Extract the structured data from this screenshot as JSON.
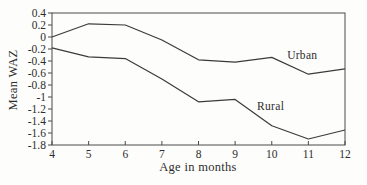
{
  "figure": {
    "background": "#fdfdfc",
    "line_color": "#3b3b3b",
    "frame_color": "#4a4a4a",
    "text_color": "#2d2d2d"
  },
  "chart_data": {
    "type": "line",
    "title": "",
    "xlabel": "Age in months",
    "ylabel": "Mean WAZ",
    "xlim": [
      4,
      12
    ],
    "ylim": [
      -1.8,
      0.4
    ],
    "grid": false,
    "legend_position": "inline-annotations",
    "x": [
      4,
      5,
      6,
      7,
      8,
      9,
      10,
      11,
      12
    ],
    "xticks": [
      "4",
      "5",
      "6",
      "7",
      "8",
      "9",
      "10",
      "11",
      "12"
    ],
    "ytick_values": [
      0.4,
      0.2,
      0,
      -0.2,
      -0.4,
      -0.6,
      -0.8,
      -1,
      -1.2,
      -1.4,
      -1.6,
      -1.8
    ],
    "yticks": [
      "0.4",
      "0.2",
      "0",
      "-0.2",
      "-0.4",
      "-0.6",
      "-0.8",
      "-1",
      "-1.2",
      "-1.4",
      "-1.6",
      "-1.8"
    ],
    "series": [
      {
        "name": "Urban",
        "values": [
          0.0,
          0.22,
          0.2,
          -0.05,
          -0.38,
          -0.42,
          -0.34,
          -0.62,
          -0.53
        ]
      },
      {
        "name": "Rural",
        "values": [
          -0.18,
          -0.33,
          -0.36,
          -0.7,
          -1.08,
          -1.04,
          -1.48,
          -1.7,
          -1.55
        ]
      }
    ],
    "annotations": [
      {
        "text": "Urban",
        "x": 10.42,
        "y": -0.3
      },
      {
        "text": "Rural",
        "x": 9.6,
        "y": -1.15
      }
    ]
  }
}
